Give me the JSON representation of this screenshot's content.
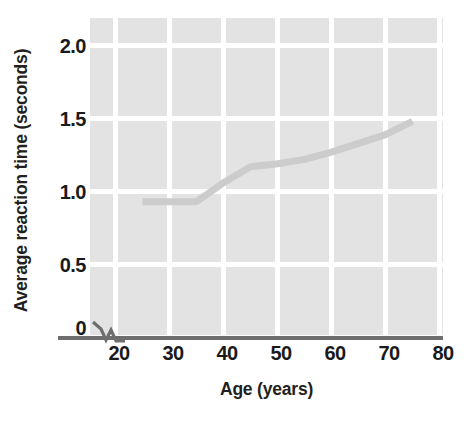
{
  "chart_data": {
    "type": "line",
    "title": "",
    "xlabel": "Age (years)",
    "ylabel": "Average reaction time (seconds)",
    "xlim": [
      15,
      80
    ],
    "ylim": [
      0,
      2.15
    ],
    "grid": true,
    "legend": false,
    "axis_break": true,
    "x_ticks": [
      20,
      30,
      40,
      50,
      60,
      70,
      80
    ],
    "x_tick_labels": [
      "20",
      "30",
      "40",
      "50",
      "60",
      "70",
      "80"
    ],
    "y_ticks": [
      0,
      0.5,
      1.0,
      1.5,
      2.0
    ],
    "y_tick_labels": [
      "0",
      "0.5",
      "1.0",
      "1.5",
      "2.0"
    ],
    "series": [
      {
        "name": "Average reaction time",
        "color": "#cccccc",
        "x": [
          25,
          30,
          35,
          40,
          45,
          50,
          55,
          60,
          65,
          70,
          75
        ],
        "values": [
          0.93,
          0.93,
          0.93,
          1.06,
          1.17,
          1.19,
          1.22,
          1.27,
          1.33,
          1.39,
          1.48
        ]
      }
    ]
  },
  "figure": {
    "plot_background_color": "#e3e3e3",
    "gridline_color": "#ffffff",
    "axis_color": "#6e6e6e",
    "text_color": "#231f20",
    "line_color": "#cccccc"
  }
}
